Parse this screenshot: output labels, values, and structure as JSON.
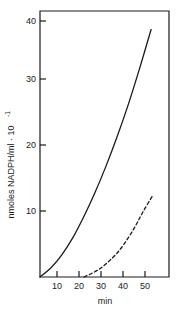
{
  "chart_data": {
    "type": "line",
    "title": "",
    "subtitle": "",
    "xlabel": "min",
    "ylabel": "nmoles NADPH/ml · 10",
    "ylabel_exponent": "-1",
    "xlim": [
      0,
      56
    ],
    "ylim": [
      0,
      42
    ],
    "grid": false,
    "legend": null,
    "xticks": [
      10,
      20,
      30,
      40,
      50
    ],
    "xtick_labels": [
      "10",
      "20",
      "30",
      "40",
      "50"
    ],
    "yticks": [
      10,
      20,
      30,
      40
    ],
    "ytick_labels": [
      "10",
      "20",
      "30",
      "40"
    ],
    "series": [
      {
        "name": "solid-curve",
        "style": "solid",
        "color": "#1a1a1a",
        "x": [
          0,
          5,
          10,
          15,
          20,
          25,
          30,
          35,
          40,
          45,
          50.5
        ],
        "values": [
          0,
          1.4,
          3.4,
          6.0,
          9.2,
          12.8,
          16.8,
          21.2,
          26.0,
          31.3,
          37.5
        ]
      },
      {
        "name": "dashed-curve",
        "style": "dashed",
        "color": "#1a1a1a",
        "x": [
          20,
          23,
          26,
          29,
          32,
          35,
          38,
          41,
          44,
          47,
          51
        ],
        "values": [
          0,
          0.45,
          1.0,
          1.7,
          2.6,
          3.6,
          4.9,
          6.4,
          8.1,
          10.0,
          12.2
        ]
      }
    ]
  },
  "axes": {
    "x_axis_name": "x-axis",
    "y_axis_name": "y-axis",
    "frame": "box"
  }
}
